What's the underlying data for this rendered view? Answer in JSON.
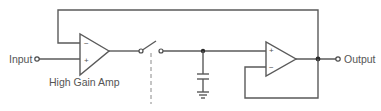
{
  "diagram": {
    "type": "circuit-schematic",
    "labels": {
      "input": "Input",
      "output": "Output",
      "amp1": "High Gain Amp"
    },
    "amp1_signs": {
      "minus": "−",
      "plus": "+"
    },
    "amp2_signs": {
      "plus": "+",
      "minus": "−"
    },
    "components": [
      {
        "id": "input-terminal",
        "kind": "terminal"
      },
      {
        "id": "high-gain-amp",
        "kind": "op-amp"
      },
      {
        "id": "switch",
        "kind": "spst-switch",
        "state": "open"
      },
      {
        "id": "hold-capacitor",
        "kind": "capacitor"
      },
      {
        "id": "ground",
        "kind": "ground"
      },
      {
        "id": "buffer-amp",
        "kind": "op-amp",
        "config": "voltage-follower"
      },
      {
        "id": "output-terminal",
        "kind": "terminal"
      }
    ],
    "colors": {
      "wire": "#5a5a5a",
      "text": "#555555",
      "background": "#ffffff"
    }
  }
}
